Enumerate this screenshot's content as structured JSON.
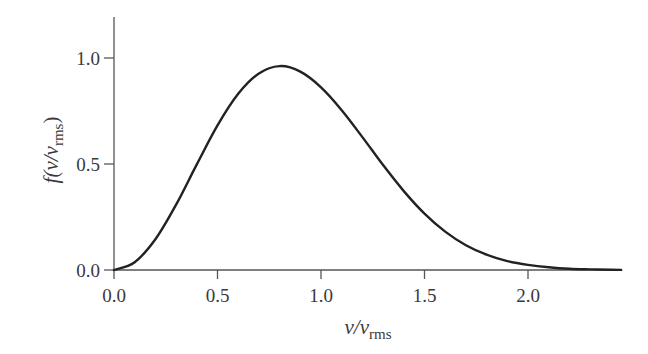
{
  "chart_data": {
    "type": "line",
    "title": "",
    "xlabel": "v/v_rms",
    "ylabel": "f(v/v_rms)",
    "xlim": [
      0.0,
      2.45
    ],
    "ylim": [
      0.0,
      1.2
    ],
    "x_ticks": [
      "0.0",
      "0.5",
      "1.0",
      "1.5",
      "2.0"
    ],
    "y_ticks": [
      "0.0",
      "0.5",
      "1.0"
    ],
    "grid": false,
    "legend": null,
    "series": [
      {
        "name": "Maxwell speed distribution",
        "x": [
          0.0,
          0.1,
          0.2,
          0.3,
          0.4,
          0.5,
          0.6,
          0.7,
          0.8,
          0.9,
          1.0,
          1.1,
          1.2,
          1.3,
          1.4,
          1.5,
          1.6,
          1.7,
          1.8,
          1.9,
          2.0,
          2.1,
          2.2,
          2.3,
          2.4
        ],
        "values": [
          0.0,
          0.037,
          0.145,
          0.308,
          0.498,
          0.682,
          0.831,
          0.927,
          0.962,
          0.936,
          0.862,
          0.754,
          0.627,
          0.495,
          0.372,
          0.266,
          0.181,
          0.117,
          0.072,
          0.042,
          0.024,
          0.013,
          0.006,
          0.003,
          0.001
        ]
      }
    ]
  },
  "axes": {
    "x_label_main": "v/v",
    "x_label_sub": "rms",
    "y_label_prefix": "f(v/v",
    "y_label_sub": "rms",
    "y_label_suffix": ")"
  }
}
